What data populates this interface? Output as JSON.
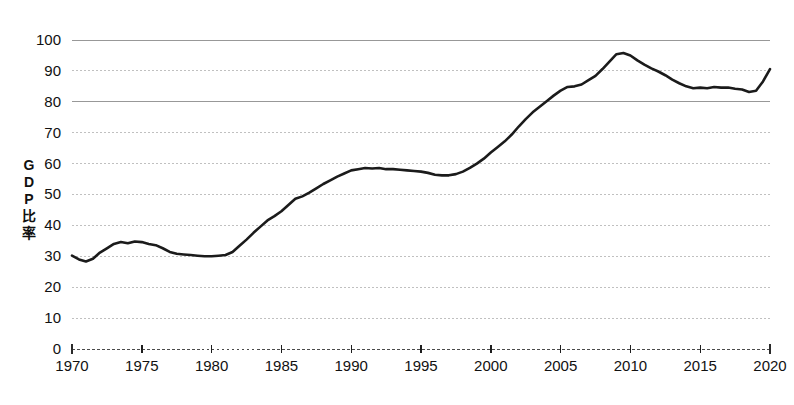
{
  "chart_data": {
    "type": "line",
    "title": "",
    "xlabel": "",
    "ylabel": "GDP比率",
    "ylabel_chars": [
      "G",
      "D",
      "P",
      "比",
      "率"
    ],
    "xlim": [
      1970,
      2020
    ],
    "ylim": [
      0,
      100
    ],
    "grid": true,
    "legend": "none",
    "line_color": "#1b1b1b",
    "grid_color": "#b9b9b9",
    "axis_color": "#2a2a2a",
    "yticks": [
      100,
      90,
      80,
      70,
      60,
      50,
      40,
      30,
      20,
      10,
      0
    ],
    "ytick_labels": [
      "100",
      "90",
      "80",
      "70",
      "60",
      "50",
      "40",
      "30",
      "20",
      "10",
      "0"
    ],
    "xticks": [
      1970,
      1975,
      1980,
      1985,
      1990,
      1995,
      2000,
      2005,
      2010,
      2015,
      2020
    ],
    "xtick_labels": [
      "1970",
      "1975",
      "1980",
      "1985",
      "1990",
      "1995",
      "2000",
      "2005",
      "2010",
      "2015",
      "2020"
    ],
    "series": [
      {
        "name": "GDP比率",
        "x": [
          1970,
          1970.5,
          1971,
          1971.5,
          1972,
          1972.5,
          1973,
          1973.5,
          1974,
          1974.5,
          1975,
          1975.5,
          1976,
          1976.5,
          1977,
          1977.5,
          1978,
          1978.5,
          1979,
          1979.5,
          1980,
          1980.5,
          1981,
          1981.5,
          1982,
          1982.5,
          1983,
          1983.5,
          1984,
          1984.5,
          1985,
          1985.5,
          1986,
          1986.5,
          1987,
          1987.5,
          1988,
          1988.5,
          1989,
          1989.5,
          1990,
          1990.5,
          1991,
          1991.5,
          1992,
          1992.5,
          1993,
          1993.5,
          1994,
          1994.5,
          1995,
          1995.5,
          1996,
          1996.5,
          1997,
          1997.5,
          1998,
          1998.5,
          1999,
          1999.5,
          2000,
          2000.5,
          2001,
          2001.5,
          2002,
          2002.5,
          2003,
          2003.5,
          2004,
          2004.5,
          2005,
          2005.5,
          2006,
          2006.5,
          2007,
          2007.5,
          2008,
          2008.5,
          2009,
          2009.5,
          2010,
          2010.5,
          2011,
          2011.5,
          2012,
          2012.5,
          2013,
          2013.5,
          2014,
          2014.5,
          2015,
          2015.5,
          2016,
          2016.5,
          2017,
          2017.5,
          2018,
          2018.5,
          2019,
          2019.5,
          2020
        ],
        "y": [
          30.2,
          29.0,
          28.3,
          29.2,
          31.2,
          32.6,
          34.0,
          34.6,
          34.2,
          34.8,
          34.6,
          34.0,
          33.6,
          32.6,
          31.4,
          30.8,
          30.6,
          30.4,
          30.2,
          30.0,
          30.0,
          30.2,
          30.4,
          31.4,
          33.4,
          35.4,
          37.6,
          39.6,
          41.6,
          43.0,
          44.6,
          46.6,
          48.6,
          49.4,
          50.6,
          52.0,
          53.4,
          54.6,
          55.8,
          56.8,
          57.8,
          58.2,
          58.6,
          58.4,
          58.6,
          58.2,
          58.2,
          58.0,
          57.8,
          57.6,
          57.4,
          57.0,
          56.4,
          56.2,
          56.2,
          56.6,
          57.4,
          58.6,
          60.0,
          61.6,
          63.6,
          65.4,
          67.2,
          69.4,
          72.0,
          74.4,
          76.6,
          78.4,
          80.2,
          82.0,
          83.6,
          84.8,
          85.0,
          85.6,
          87.0,
          88.4,
          90.6,
          93.0,
          95.4,
          95.8,
          95.0,
          93.4,
          92.0,
          90.8,
          89.8,
          88.6,
          87.2,
          86.0,
          85.0,
          84.4,
          84.6,
          84.4,
          84.8,
          84.6,
          84.6,
          84.2,
          84.0,
          83.2,
          83.6,
          86.6,
          90.6
        ]
      }
    ]
  },
  "plot_geometry": {
    "left": 72,
    "right": 770,
    "top": 40,
    "bottom": 349
  }
}
